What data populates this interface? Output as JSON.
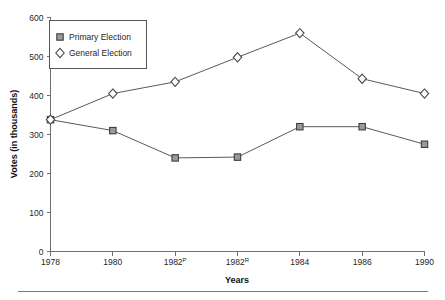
{
  "chart_data": {
    "type": "line",
    "title": "",
    "xlabel": "Years",
    "ylabel": "Votes (in thousands)",
    "categories": [
      "1978",
      "1980",
      "1982P",
      "1982R",
      "1984",
      "1986",
      "1990"
    ],
    "category_marks": [
      "",
      "",
      "P",
      "R",
      "",
      "",
      ""
    ],
    "category_bases": [
      "1978",
      "1980",
      "1982",
      "1982",
      "1984",
      "1986",
      "1990"
    ],
    "xlim": [
      0,
      6
    ],
    "ylim": [
      0,
      600
    ],
    "yticks": [
      0,
      100,
      200,
      300,
      400,
      500,
      600
    ],
    "ytick_labels": [
      "0",
      "100",
      "200",
      "300",
      "400",
      "500",
      "600"
    ],
    "grid": false,
    "legend_position": "upper-left",
    "series": [
      {
        "name": "Primary Election",
        "marker": "square",
        "color": "#9a9a9a",
        "values": [
          338,
          310,
          240,
          242,
          320,
          320,
          275
        ]
      },
      {
        "name": "General Election",
        "marker": "diamond",
        "color": "#fdfdfd",
        "values": [
          338,
          405,
          435,
          498,
          560,
          443,
          405
        ]
      }
    ]
  },
  "legend": {
    "items": [
      {
        "label": "Primary Election",
        "marker": "square"
      },
      {
        "label": "General Election",
        "marker": "diamond"
      }
    ]
  },
  "axes": {
    "y_title": "Votes (in thousands)",
    "x_title": "Years"
  },
  "colors": {
    "axis": "#6f6f6f",
    "line": "#5a5a5a",
    "square_fill": "#9a9a9a",
    "square_stroke": "#3d3d3d",
    "diamond_fill": "#fdfdfd",
    "diamond_stroke": "#4a4a4a",
    "text": "#262626",
    "background": "#ffffff"
  }
}
